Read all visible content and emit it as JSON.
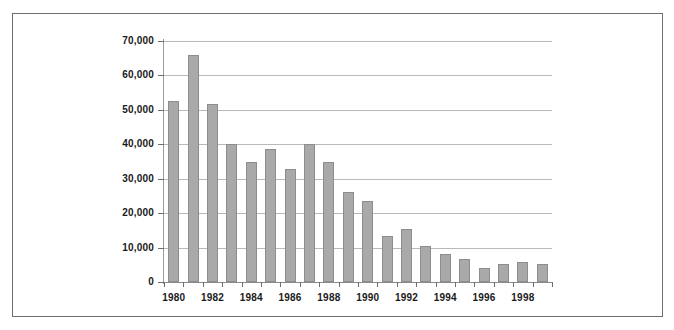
{
  "chart_data": {
    "type": "bar",
    "title": "",
    "subtitle": "",
    "xlabel": "",
    "ylabel": "",
    "grid": true,
    "legend": false,
    "legend_position": "none",
    "bar_color": "#a9a9a9",
    "bar_border_color": "#8d8d8d",
    "gridline_color": "#b9b9b9",
    "axis_color": "#6e6e6e",
    "frame_color": "#6e6e6e",
    "background": "#ffffff",
    "categories": [
      "1980",
      "1981",
      "1982",
      "1983",
      "1984",
      "1985",
      "1986",
      "1987",
      "1988",
      "1989",
      "1990",
      "1991",
      "1992",
      "1993",
      "1994",
      "1995",
      "1996",
      "1997",
      "1998",
      "1999"
    ],
    "values": [
      52500,
      66000,
      51800,
      40200,
      35000,
      38500,
      32800,
      40000,
      34800,
      26200,
      23400,
      13300,
      15300,
      10500,
      8000,
      6800,
      4100,
      5300,
      5900,
      5200
    ],
    "x_tick_labels": [
      "1980",
      "",
      "1982",
      "",
      "1984",
      "",
      "1986",
      "",
      "1988",
      "",
      "1990",
      "",
      "1992",
      "",
      "1994",
      "",
      "1996",
      "",
      "1998",
      ""
    ],
    "ylim": [
      0,
      70000
    ],
    "ytick_values": [
      0,
      10000,
      20000,
      30000,
      40000,
      50000,
      60000,
      70000
    ],
    "ytick_labels": [
      "0",
      "10,000",
      "20,000",
      "30,000",
      "40,000",
      "50,000",
      "60,000",
      "70,000"
    ]
  }
}
